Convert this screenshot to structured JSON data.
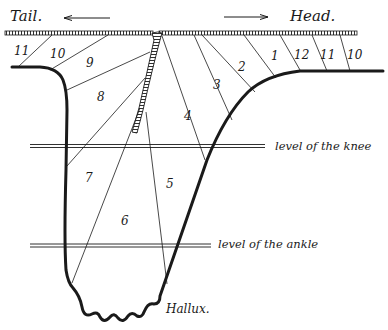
{
  "labels": {
    "tail": "Tail.",
    "head": "Head.",
    "knee": "level of the knee",
    "ankle": "level of the ankle",
    "hallux": "Hallux."
  },
  "arrows": {
    "tail_direction": "left",
    "head_direction": "right"
  },
  "segments": {
    "left": [
      "11",
      "10",
      "9",
      "8",
      "7",
      "6"
    ],
    "right": [
      "5",
      "4",
      "3",
      "2",
      "1",
      "12",
      "11",
      "10"
    ]
  },
  "segment_labels": [
    {
      "id": "s11L",
      "text": "11",
      "x": 14,
      "y": 54
    },
    {
      "id": "s10L",
      "text": "10",
      "x": 50,
      "y": 57
    },
    {
      "id": "s9",
      "text": "9",
      "x": 86,
      "y": 65
    },
    {
      "id": "s8",
      "text": "8",
      "x": 98,
      "y": 100
    },
    {
      "id": "s7",
      "text": "7",
      "x": 85,
      "y": 180
    },
    {
      "id": "s6",
      "text": "6",
      "x": 122,
      "y": 224
    },
    {
      "id": "s5",
      "text": "5",
      "x": 166,
      "y": 187
    },
    {
      "id": "s4",
      "text": "4",
      "x": 184,
      "y": 118
    },
    {
      "id": "s3",
      "text": "3",
      "x": 213,
      "y": 88
    },
    {
      "id": "s2",
      "text": "2",
      "x": 238,
      "y": 70
    },
    {
      "id": "s1",
      "text": "1",
      "x": 272,
      "y": 60
    },
    {
      "id": "s12",
      "text": "12",
      "x": 296,
      "y": 58
    },
    {
      "id": "s11R",
      "text": "11",
      "x": 321,
      "y": 58
    },
    {
      "id": "s10R",
      "text": "10",
      "x": 348,
      "y": 58
    }
  ],
  "colors": {
    "ink": "#1a1a1a",
    "background": "#ffffff"
  }
}
